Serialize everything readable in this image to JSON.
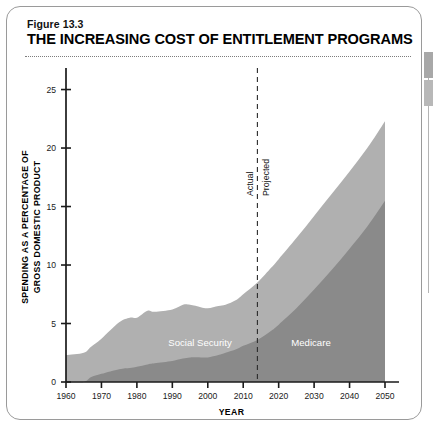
{
  "figure": {
    "number": "Figure 13.3",
    "title": "THE INCREASING COST OF ENTITLEMENT PROGRAMS"
  },
  "chart_data": {
    "type": "area",
    "title": "THE INCREASING COST OF ENTITLEMENT PROGRAMS",
    "xlabel": "YEAR",
    "ylabel": "SPENDING AS A PERCENTAGE OF GROSS DOMESTIC PRODUCT",
    "stacked": true,
    "grid": false,
    "legend_position": "inline-area-labels",
    "xlim": [
      1960,
      2050
    ],
    "ylim": [
      0,
      26.5
    ],
    "xticks": [
      1960,
      1970,
      1980,
      1990,
      2000,
      2010,
      2020,
      2030,
      2040,
      2050
    ],
    "xtick_labels": [
      "1960",
      "1970",
      "1980",
      "1990",
      "2000",
      "2010",
      "2020",
      "2030",
      "2040",
      "2050"
    ],
    "yticks": [
      0,
      5,
      10,
      15,
      20,
      25
    ],
    "ytick_labels": [
      "0",
      "5",
      "10",
      "15",
      "20",
      "25"
    ],
    "x": [
      1960,
      1965,
      1967,
      1970,
      1975,
      1978,
      1980,
      1983,
      1985,
      1990,
      1993,
      1995,
      1998,
      2000,
      2003,
      2005,
      2008,
      2010,
      2014,
      2018,
      2020,
      2025,
      2030,
      2035,
      2040,
      2045,
      2050
    ],
    "series": [
      {
        "name": "Medicare",
        "label": "Medicare",
        "color": "#8a8a8a",
        "values": [
          0.0,
          0.0,
          0.4,
          0.7,
          1.1,
          1.2,
          1.3,
          1.5,
          1.6,
          1.8,
          2.0,
          2.1,
          2.1,
          2.1,
          2.3,
          2.5,
          2.8,
          3.1,
          3.6,
          4.4,
          4.9,
          6.3,
          7.9,
          9.6,
          11.4,
          13.3,
          15.5
        ]
      },
      {
        "name": "Social Security",
        "label": "Social Security",
        "color": "#b0b0b0",
        "values": [
          2.3,
          2.5,
          2.6,
          3.0,
          4.0,
          4.3,
          4.2,
          4.6,
          4.4,
          4.4,
          4.6,
          4.5,
          4.3,
          4.2,
          4.2,
          4.1,
          4.2,
          4.4,
          4.9,
          5.4,
          5.6,
          6.0,
          6.3,
          6.5,
          6.6,
          6.7,
          6.8
        ]
      }
    ],
    "annotation_divider": {
      "x": 2014,
      "style": "dashed",
      "left_label": "Actual",
      "right_label": "Projected"
    }
  }
}
